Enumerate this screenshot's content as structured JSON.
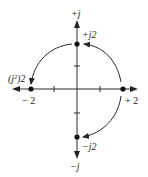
{
  "diagram": {
    "labels": {
      "pos_imag_axis": "+j",
      "neg_imag_axis": "−j",
      "pos_j2": "+j2",
      "neg_j2": "−j2",
      "j_squared_2": "(j²)2",
      "neg_2": "− 2",
      "pos_2": "+ 2"
    },
    "points": [
      {
        "name": "+2",
        "re": 2,
        "im": 0
      },
      {
        "name": "+j2",
        "re": 0,
        "im": 2
      },
      {
        "name": "(j^2)2 = -2",
        "re": -2,
        "im": 0
      },
      {
        "name": "-j2",
        "re": 0,
        "im": -2
      }
    ],
    "arrows": [
      {
        "from": "+2",
        "to": "+j2",
        "meaning": "multiply by j (rotate +90°)"
      },
      {
        "from": "+j2",
        "to": "(j^2)2",
        "meaning": "multiply by j again (rotate +90°)"
      },
      {
        "from": "+2",
        "to": "-j2",
        "meaning": "multiply by -j (rotate -90°)"
      }
    ],
    "colors": {
      "ink": "#222222",
      "background": "#ffffff"
    }
  }
}
